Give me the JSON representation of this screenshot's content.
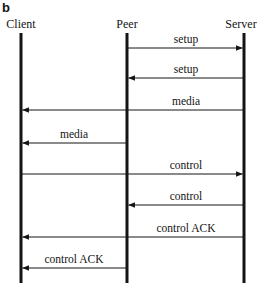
{
  "figure": {
    "panel_letter": "b",
    "type": "sequence-diagram",
    "width": 261,
    "height": 288,
    "background_color": "#ffffff",
    "line_color": "#141414"
  },
  "actors": [
    {
      "id": "client",
      "label": "Client",
      "x": 21,
      "label_x": 21,
      "label_y": 17
    },
    {
      "id": "peer",
      "label": "Peer",
      "x": 127,
      "label_x": 127,
      "label_y": 17
    },
    {
      "id": "server",
      "label": "Server",
      "x": 244,
      "label_x": 241,
      "label_y": 17
    }
  ],
  "lifelines": {
    "top_y": 33,
    "bottom_y": 283,
    "stroke_width": 3
  },
  "messages": [
    {
      "index": 0,
      "label": "setup",
      "from": "peer",
      "to": "server",
      "direction": "right",
      "x1": 127,
      "x2": 244,
      "y": 48,
      "label_x": 186,
      "label_y": 33
    },
    {
      "index": 1,
      "label": "setup",
      "from": "server",
      "to": "peer",
      "direction": "left",
      "x1": 244,
      "x2": 127,
      "y": 78,
      "label_x": 186,
      "label_y": 63
    },
    {
      "index": 2,
      "label": "media",
      "from": "server",
      "to": "client",
      "direction": "left",
      "x1": 244,
      "x2": 21,
      "y": 110,
      "label_x": 186,
      "label_y": 95
    },
    {
      "index": 3,
      "label": "media",
      "from": "peer",
      "to": "client",
      "direction": "left",
      "x1": 127,
      "x2": 21,
      "y": 143,
      "label_x": 74,
      "label_y": 128
    },
    {
      "index": 4,
      "label": "control",
      "from": "client",
      "to": "server",
      "direction": "right",
      "x1": 21,
      "x2": 244,
      "y": 174,
      "label_x": 186,
      "label_y": 159
    },
    {
      "index": 5,
      "label": "control",
      "from": "server",
      "to": "peer",
      "direction": "left",
      "x1": 244,
      "x2": 127,
      "y": 205,
      "label_x": 186,
      "label_y": 190
    },
    {
      "index": 6,
      "label": "control ACK",
      "from": "server",
      "to": "client",
      "direction": "left",
      "x1": 244,
      "x2": 21,
      "y": 237,
      "label_x": 186,
      "label_y": 222
    },
    {
      "index": 7,
      "label": "control ACK",
      "from": "peer",
      "to": "client",
      "direction": "left",
      "x1": 127,
      "x2": 21,
      "y": 268,
      "label_x": 74,
      "label_y": 253
    }
  ]
}
